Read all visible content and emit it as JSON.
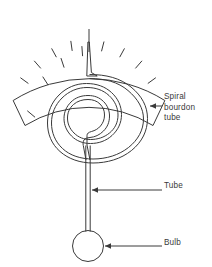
{
  "diagram": {
    "stroke_color": "#3a3a3a",
    "background_color": "#ffffff",
    "labels": [
      {
        "id": "spiral",
        "lines": [
          "Spiral",
          "bourdon",
          "tube"
        ],
        "text": "Spiral bourdon tube"
      },
      {
        "id": "tube",
        "lines": [
          "Tube"
        ],
        "text": "Tube"
      },
      {
        "id": "bulb",
        "lines": [
          "Bulb"
        ],
        "text": "Bulb"
      }
    ],
    "label_spiral_line1": "Spiral",
    "label_spiral_line2": "bourdon",
    "label_spiral_line3": "tube",
    "label_tube": "Tube",
    "label_bulb": "Bulb",
    "scale": {
      "tick_count": 11,
      "center_tick_index": 5,
      "arc_start_deg": -150,
      "arc_end_deg": -30
    },
    "components": [
      {
        "name": "dial-scale-arc",
        "description": "curved graduated scale band"
      },
      {
        "name": "pointer-needle",
        "description": "tapered needle pointing to center tick"
      },
      {
        "name": "spiral-bourdon-tube",
        "description": "double-line spiral coil"
      },
      {
        "name": "capillary-tube",
        "description": "vertical double-line tube"
      },
      {
        "name": "bulb",
        "description": "circular sensing bulb"
      }
    ]
  }
}
